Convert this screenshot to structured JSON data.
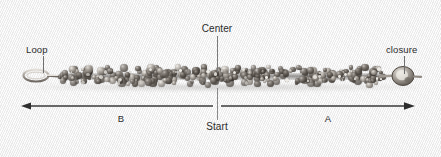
{
  "figure": {
    "background_color": "#f2f2f2",
    "line_color": "#333333",
    "text_color": "#2b2b2b"
  },
  "annotations": {
    "center_label": "Center",
    "loop_label": "Loop",
    "closure_label": "closure",
    "start_label": "Start",
    "segment_b_label": "B",
    "segment_a_label": "A"
  },
  "measure": {
    "arrow_style": "double-headed",
    "left_arrow_x": 22,
    "right_arrow_x": 414,
    "axis_y": 106,
    "divider_x": 217
  },
  "object": {
    "name": "beaded-bracelet",
    "bead_color": "#4a443e",
    "bead_highlight_color": "#d8d3cc",
    "clasp_color": "#b3aea7",
    "left_end": "loop",
    "right_end": "closure"
  }
}
